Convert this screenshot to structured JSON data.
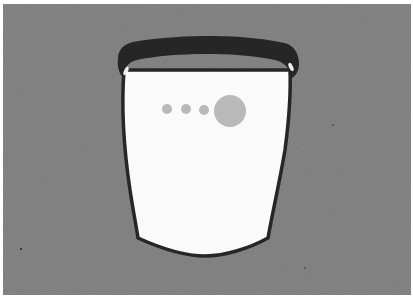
{
  "illustration": {
    "title": "Container with dots",
    "background_color": "#7b7b7b",
    "border_color": "#ffffff",
    "rim_color": "#262626",
    "body_fill": "#fafafa",
    "outline_color": "#262626",
    "dot_color": "#b9b9b9",
    "dots": [
      {
        "cx": 167,
        "cy": 109,
        "r": 5
      },
      {
        "cx": 186,
        "cy": 109,
        "r": 5
      },
      {
        "cx": 204,
        "cy": 110,
        "r": 5
      },
      {
        "cx": 230,
        "cy": 111,
        "r": 16
      }
    ]
  }
}
